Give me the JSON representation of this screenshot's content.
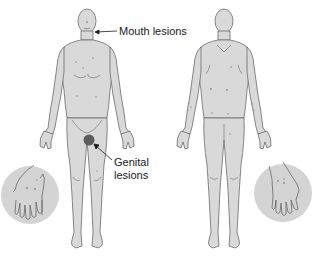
{
  "figure": {
    "type": "anatomical-diagram",
    "views": [
      {
        "name": "front",
        "label": ""
      },
      {
        "name": "back",
        "label": ""
      }
    ],
    "annotations": [
      {
        "id": "mouth",
        "line1": "Mouth lesions",
        "line2": ""
      },
      {
        "id": "genital",
        "line1": "Genital",
        "line2": "lesions"
      }
    ],
    "insets": [
      {
        "name": "left-hand-palm-inset",
        "position": "bottom-left"
      },
      {
        "name": "right-hand-palm-inset",
        "position": "bottom-right"
      }
    ],
    "colors": {
      "body_fill": "#d9d9d9",
      "body_outline": "#6b6b6b",
      "inset_fill": "#d4d4d4",
      "lesion": "#7a7a7a",
      "genital_lesion": "#5c5c5c",
      "text": "#1a1a1a"
    }
  }
}
